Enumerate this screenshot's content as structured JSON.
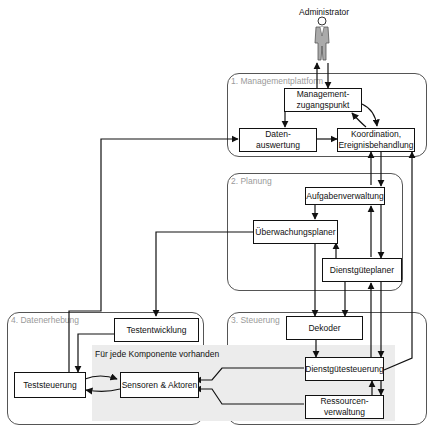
{
  "actor": {
    "label": "Administrator",
    "icon": "person-icon"
  },
  "regions": [
    {
      "id": "managementplattform",
      "label": "1. Managementplattform"
    },
    {
      "id": "planung",
      "label": "2. Planung"
    },
    {
      "id": "steuerung",
      "label": "3. Steuerung"
    },
    {
      "id": "datenerhebung",
      "label": "4. Datenerhebung"
    }
  ],
  "shaded_area": {
    "label": "Für jede Komponente vorhanden"
  },
  "components": {
    "managementzugangspunkt": "Management-\nzugangspunkt",
    "datenauswertung": "Daten-\nauswertung",
    "koordination": "Koordination,\nEreignisbehandlung",
    "aufgabenverwaltung": "Aufgabenverwaltung",
    "ueberwachungsplaner": "Überwachungsplaner",
    "dienstgueteplaner": "Dienstgüteplaner",
    "dekoder": "Dekoder",
    "dienstguetesteuerung": "Dienstgütesteuerung",
    "ressourcenverwaltung": "Ressourcen-\nverwaltung",
    "testentwicklung": "Testentwicklung",
    "teststeuerung": "Teststeuerung",
    "sensoren_aktoren": "Sensoren & Aktoren"
  },
  "colors": {
    "line": "#111111",
    "region_border": "#555555",
    "region_label": "#9a9a9a",
    "shade": "#ececec"
  }
}
